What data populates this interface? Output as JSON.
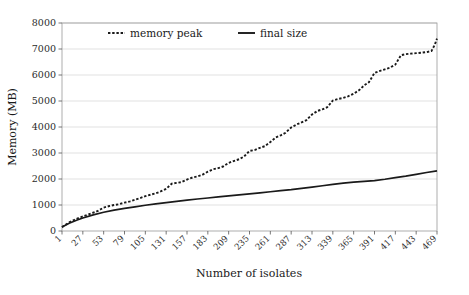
{
  "chart_data": {
    "type": "line",
    "title": "",
    "xlabel": "Number of isolates",
    "ylabel": "Memory (MB)",
    "xlim": [
      1,
      469
    ],
    "ylim": [
      0,
      8000
    ],
    "grid": true,
    "grid_axis": "y",
    "legend_position": "top-inside-left",
    "ytick_labels": [
      "0",
      "1000",
      "2000",
      "3000",
      "4000",
      "5000",
      "6000",
      "7000",
      "8000"
    ],
    "ytick_values": [
      0,
      1000,
      2000,
      3000,
      4000,
      5000,
      6000,
      7000,
      8000
    ],
    "xtick_labels": [
      "1",
      "27",
      "53",
      "79",
      "105",
      "131",
      "157",
      "183",
      "209",
      "235",
      "261",
      "287",
      "313",
      "339",
      "365",
      "391",
      "417",
      "443",
      "469"
    ],
    "xtick_values": [
      1,
      27,
      53,
      79,
      105,
      131,
      157,
      183,
      209,
      235,
      261,
      287,
      313,
      339,
      365,
      391,
      417,
      443,
      469
    ],
    "series": [
      {
        "name": "memory peak",
        "style": "dotted",
        "color": "#1a1a1a",
        "x": [
          1,
          10,
          20,
          27,
          35,
          45,
          53,
          60,
          66,
          72,
          79,
          86,
          92,
          98,
          105,
          112,
          118,
          124,
          131,
          138,
          144,
          150,
          157,
          164,
          170,
          176,
          183,
          190,
          196,
          202,
          209,
          216,
          222,
          228,
          235,
          242,
          248,
          254,
          261,
          268,
          274,
          280,
          287,
          294,
          300,
          306,
          313,
          320,
          326,
          332,
          339,
          346,
          352,
          358,
          365,
          372,
          378,
          384,
          391,
          398,
          404,
          410,
          417,
          424,
          430,
          436,
          443,
          450,
          456,
          462,
          466,
          469
        ],
        "y": [
          150,
          330,
          480,
          560,
          650,
          760,
          900,
          960,
          1000,
          1030,
          1090,
          1140,
          1200,
          1260,
          1340,
          1400,
          1450,
          1520,
          1620,
          1820,
          1850,
          1880,
          1980,
          2060,
          2100,
          2160,
          2280,
          2380,
          2420,
          2480,
          2620,
          2700,
          2760,
          2860,
          3080,
          3120,
          3200,
          3260,
          3420,
          3600,
          3680,
          3780,
          3980,
          4100,
          4180,
          4260,
          4480,
          4620,
          4680,
          4760,
          5020,
          5080,
          5120,
          5180,
          5280,
          5420,
          5600,
          5720,
          6080,
          6160,
          6220,
          6280,
          6400,
          6760,
          6800,
          6820,
          6840,
          6860,
          6880,
          6920,
          7150,
          7400
        ]
      },
      {
        "name": "final size",
        "style": "solid",
        "color": "#1a1a1a",
        "x": [
          1,
          10,
          20,
          27,
          40,
          53,
          66,
          79,
          92,
          105,
          118,
          131,
          144,
          157,
          170,
          183,
          196,
          209,
          222,
          235,
          248,
          261,
          274,
          287,
          300,
          313,
          326,
          339,
          352,
          365,
          378,
          391,
          404,
          417,
          430,
          443,
          456,
          469
        ],
        "y": [
          150,
          300,
          420,
          500,
          620,
          720,
          800,
          870,
          930,
          990,
          1040,
          1090,
          1140,
          1190,
          1230,
          1270,
          1310,
          1350,
          1390,
          1430,
          1470,
          1510,
          1550,
          1590,
          1640,
          1690,
          1740,
          1790,
          1840,
          1880,
          1910,
          1940,
          1990,
          2050,
          2110,
          2180,
          2250,
          2310
        ]
      }
    ]
  }
}
